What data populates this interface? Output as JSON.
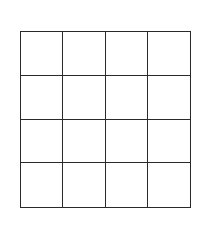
{
  "grid": {
    "rows": 4,
    "columns": 4,
    "line_color": "#2a2a2a",
    "cell_fill": "#ffffff",
    "cells": [
      [
        "",
        "",
        "",
        ""
      ],
      [
        "",
        "",
        "",
        ""
      ],
      [
        "",
        "",
        "",
        ""
      ],
      [
        "",
        "",
        "",
        ""
      ]
    ]
  }
}
